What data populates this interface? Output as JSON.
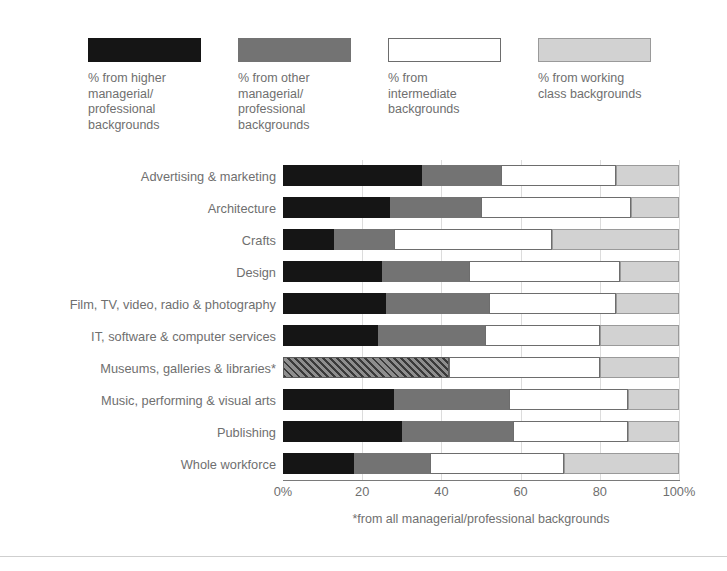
{
  "legend": {
    "items": [
      {
        "name": "higher-managerial",
        "label": "% from higher\nmanagerial/\nprofessional\nbackgrounds",
        "color": "#151515",
        "style": "solid"
      },
      {
        "name": "other-managerial",
        "label": "% from other\nmanagerial/\nprofessional\nbackgrounds",
        "color": "#737373",
        "style": "solid"
      },
      {
        "name": "intermediate",
        "label": "% from\nintermediate\nbackgrounds",
        "color": "#ffffff",
        "style": "outlined"
      },
      {
        "name": "working-class",
        "label": "% from working\nclass backgrounds",
        "color": "#d2d2d2",
        "style": "solid"
      }
    ]
  },
  "footnote": "*from all managerial/professional backgrounds",
  "chart_data": {
    "type": "bar",
    "orientation": "horizontal",
    "stacked": true,
    "normalized_percent": true,
    "title": "",
    "xlabel": "",
    "ylabel": "",
    "xlim": [
      0,
      100
    ],
    "grid": true,
    "legend_position": "top",
    "xticks": [
      0,
      20,
      40,
      60,
      80,
      100
    ],
    "xtick_labels": [
      "0%",
      "20",
      "40",
      "60",
      "80",
      "100%"
    ],
    "categories": [
      "Advertising & marketing",
      "Architecture",
      "Crafts",
      "Design",
      "Film, TV, video, radio & photography",
      "IT, software & computer services",
      "Museums, galleries & libraries*",
      "Music, performing & visual arts",
      "Publishing",
      "Whole workforce"
    ],
    "series": [
      {
        "name": "% from higher managerial/professional backgrounds",
        "key": "higher",
        "values": [
          35,
          27,
          13,
          25,
          26,
          24,
          null,
          28,
          30,
          18
        ]
      },
      {
        "name": "% from other managerial/professional backgrounds",
        "key": "other",
        "values": [
          20,
          23,
          15,
          22,
          26,
          27,
          null,
          29,
          28,
          19
        ]
      },
      {
        "name": "% from all managerial/professional backgrounds",
        "key": "hatched",
        "values": [
          null,
          null,
          null,
          null,
          null,
          null,
          42,
          null,
          null,
          null
        ]
      },
      {
        "name": "% from intermediate backgrounds",
        "key": "inter",
        "values": [
          29,
          38,
          40,
          38,
          32,
          29,
          38,
          30,
          29,
          34
        ]
      },
      {
        "name": "% from working class backgrounds",
        "key": "working",
        "values": [
          16,
          12,
          32,
          15,
          16,
          20,
          20,
          13,
          13,
          29
        ]
      }
    ]
  }
}
